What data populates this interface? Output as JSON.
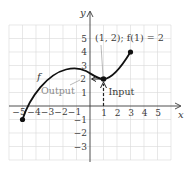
{
  "diagram": {
    "type": "function-graph",
    "axes": {
      "x_label": "x",
      "y_label": "y",
      "x_ticks": [
        {
          "value": -5,
          "label": "−5"
        },
        {
          "value": -4,
          "label": "−4"
        },
        {
          "value": -3,
          "label": "−3"
        },
        {
          "value": -2,
          "label": "−2"
        },
        {
          "value": -1,
          "label": "−1"
        },
        {
          "value": 1,
          "label": "1"
        },
        {
          "value": 2,
          "label": "2"
        },
        {
          "value": 3,
          "label": "3"
        },
        {
          "value": 4,
          "label": "4"
        },
        {
          "value": 5,
          "label": "5"
        }
      ],
      "y_ticks": [
        {
          "value": 5,
          "label": "5"
        },
        {
          "value": 4,
          "label": "4"
        },
        {
          "value": 3,
          "label": "3"
        },
        {
          "value": 2,
          "label": "2"
        },
        {
          "value": 1,
          "label": "1"
        },
        {
          "value": -1,
          "label": "−1"
        },
        {
          "value": -2,
          "label": "−2"
        },
        {
          "value": -3,
          "label": "−3"
        }
      ],
      "x_range": [
        -6,
        6
      ],
      "y_range": [
        -4,
        6
      ],
      "grid": true
    },
    "function": {
      "name": "f",
      "endpoints": [
        {
          "x": -5,
          "y": -1,
          "closed": true
        },
        {
          "x": 3,
          "y": 4,
          "closed": true
        }
      ],
      "local_max": {
        "x": -1,
        "y": 2.75
      },
      "highlighted_point": {
        "x": 1,
        "y": 2
      }
    },
    "annotations": {
      "point_label": "(1, 2); f(1) = 2",
      "output_label": "Output",
      "input_label": "Input",
      "function_label": "f"
    }
  }
}
